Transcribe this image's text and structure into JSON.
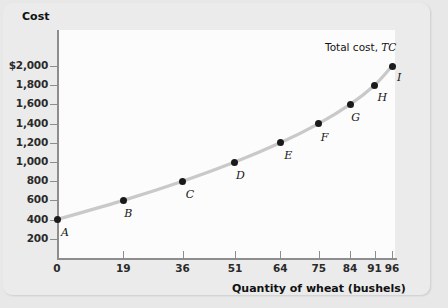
{
  "chart_data": {
    "type": "line",
    "title": "",
    "xlabel": "Quantity of wheat (bushels)",
    "ylabel": "Cost",
    "series_label": "Total cost,",
    "series_symbol": "TC",
    "xlim": [
      0,
      100
    ],
    "ylim": [
      0,
      2100
    ],
    "grid": false,
    "legend_position": "inline-right",
    "x_ticks": [
      "0",
      "19",
      "36",
      "51",
      "64",
      "75",
      "84",
      "91",
      "96"
    ],
    "x_tick_values": [
      0,
      19,
      36,
      51,
      64,
      75,
      84,
      91,
      96
    ],
    "y_ticks": [
      "200",
      "400",
      "600",
      "800",
      "1,000",
      "1,200",
      "1,400",
      "1,600",
      "1,800",
      "$2,000"
    ],
    "y_tick_values": [
      200,
      400,
      600,
      800,
      1000,
      1200,
      1400,
      1600,
      1800,
      2000
    ],
    "point_labels": [
      "A",
      "B",
      "C",
      "D",
      "E",
      "F",
      "G",
      "H",
      "I"
    ],
    "x": [
      0,
      19,
      36,
      51,
      64,
      75,
      84,
      91,
      96
    ],
    "values": [
      400,
      600,
      800,
      1000,
      1200,
      1400,
      1600,
      1800,
      2000
    ],
    "points": [
      {
        "label": "A",
        "x": 0,
        "y": 400
      },
      {
        "label": "B",
        "x": 19,
        "y": 600
      },
      {
        "label": "C",
        "x": 36,
        "y": 800
      },
      {
        "label": "D",
        "x": 51,
        "y": 1000
      },
      {
        "label": "E",
        "x": 64,
        "y": 1200
      },
      {
        "label": "F",
        "x": 75,
        "y": 1400
      },
      {
        "label": "G",
        "x": 84,
        "y": 1600
      },
      {
        "label": "H",
        "x": 91,
        "y": 1800
      },
      {
        "label": "I",
        "x": 96,
        "y": 2000
      }
    ],
    "colors": {
      "curve": "#c9c9c9",
      "point": "#1a1a1a",
      "axis": "#8d8d8d",
      "text": "#141414",
      "plot_background": "#fcfcfc",
      "figure_background": "#e8e8e8",
      "card_background": "#ebebeb"
    }
  },
  "axes": {
    "y_title": "Cost",
    "x_title": "Quantity of wheat (bushels)"
  }
}
